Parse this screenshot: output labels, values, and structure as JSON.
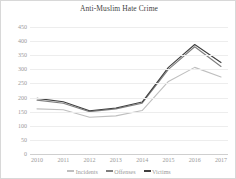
{
  "chart_data": {
    "type": "line",
    "title": "Anti-Muslim Hate Crime",
    "xlabel": "",
    "ylabel": "",
    "categories": [
      "2010",
      "2011",
      "2012",
      "2013",
      "2014",
      "2015",
      "2016",
      "2017"
    ],
    "ylim": [
      0,
      450
    ],
    "yticks": [
      0,
      50,
      100,
      150,
      200,
      250,
      300,
      350,
      400,
      450
    ],
    "grid": true,
    "legend_position": "bottom",
    "series": [
      {
        "name": "Incidents",
        "color": "#bfbfbf",
        "values": [
          160,
          157,
          130,
          135,
          154,
          257,
          307,
          273
        ]
      },
      {
        "name": "Offenses",
        "color": "#7f7f7f",
        "values": [
          191,
          180,
          150,
          160,
          180,
          300,
          380,
          310
        ]
      },
      {
        "name": "Victims",
        "color": "#3f3f3f",
        "values": [
          197,
          185,
          153,
          163,
          184,
          307,
          388,
          324
        ]
      }
    ]
  }
}
